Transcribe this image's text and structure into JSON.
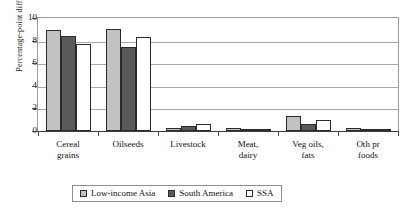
{
  "chart_data": {
    "type": "bar",
    "title": "",
    "subtitle": "",
    "xlabel": "",
    "ylabel": "Percentage-point difference",
    "ylim": [
      0,
      10
    ],
    "yticks": [
      0,
      2,
      4,
      6,
      8,
      10
    ],
    "ytick_labels": [
      "0",
      "2",
      "4",
      "6",
      "8",
      "10"
    ],
    "grid": true,
    "grid_axis": "y",
    "legend_position": "bottom",
    "categories": [
      "Cereal\ngrains",
      "Oilseeds",
      "Livestock",
      "Meat,\ndairy",
      "Veg oils,\nfats",
      "Oth pr\nfoods"
    ],
    "category_labels_flat": [
      "Cereal grains",
      "Oilseeds",
      "Livestock",
      "Meat, dairy",
      "Veg oils, fats",
      "Oth pr foods"
    ],
    "series": [
      {
        "name": "Low-income Asia",
        "color": "#c2c2c2",
        "values": [
          8.9,
          9.0,
          0.25,
          0.3,
          1.3,
          0.3
        ]
      },
      {
        "name": "South America",
        "color": "#5a5a5a",
        "values": [
          8.4,
          7.4,
          0.4,
          0.15,
          0.6,
          0.2
        ]
      },
      {
        "name": "SSA",
        "color": "#ffffff",
        "values": [
          7.7,
          8.3,
          0.6,
          0.12,
          0.95,
          0.15
        ]
      }
    ]
  },
  "legend": {
    "entries": [
      {
        "label": "Low-income Asia",
        "swatch": "#c2c2c2"
      },
      {
        "label": "South America",
        "swatch": "#5a5a5a"
      },
      {
        "label": "SSA",
        "swatch": "#ffffff"
      }
    ]
  },
  "colors": {
    "axis": "#3d3d3d",
    "grid": "#a8a8a8",
    "frame": "#9a9a9a",
    "text": "#111111",
    "bar_outline": "#2b2b2b"
  }
}
